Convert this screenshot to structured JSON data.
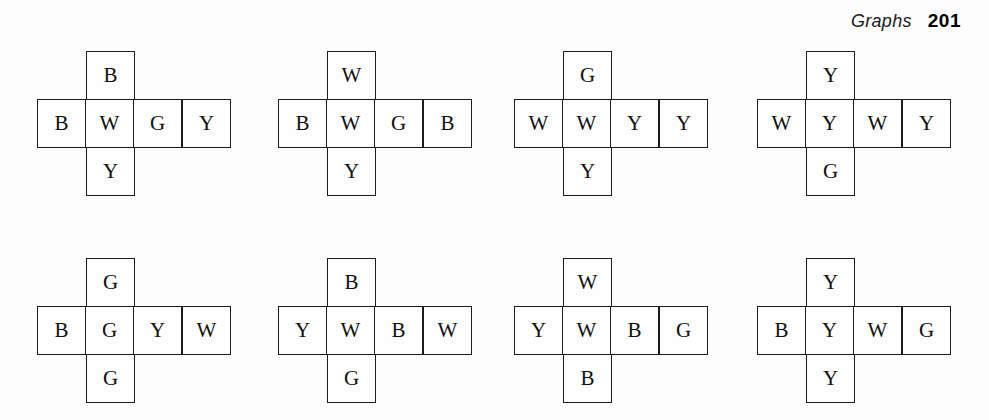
{
  "page": {
    "running_head_title": "Graphs",
    "page_number": "201",
    "background_color": "#fdfdfd",
    "ink_color": "#1c1c1c"
  },
  "figure": {
    "legend_letters": [
      "B",
      "W",
      "G",
      "Y"
    ],
    "nets": [
      {
        "id": "net-1",
        "top": "B",
        "middle": [
          "B",
          "W",
          "G",
          "Y"
        ],
        "bottom": "Y"
      },
      {
        "id": "net-2",
        "top": "W",
        "middle": [
          "B",
          "W",
          "G",
          "B"
        ],
        "bottom": "Y"
      },
      {
        "id": "net-3",
        "top": "G",
        "middle": [
          "W",
          "W",
          "Y",
          "Y"
        ],
        "bottom": "Y"
      },
      {
        "id": "net-4",
        "top": "Y",
        "middle": [
          "W",
          "Y",
          "W",
          "Y"
        ],
        "bottom": "G"
      },
      {
        "id": "net-5",
        "top": "G",
        "middle": [
          "B",
          "G",
          "Y",
          "W"
        ],
        "bottom": "G"
      },
      {
        "id": "net-6",
        "top": "B",
        "middle": [
          "Y",
          "W",
          "B",
          "W"
        ],
        "bottom": "G"
      },
      {
        "id": "net-7",
        "top": "W",
        "middle": [
          "Y",
          "W",
          "B",
          "G"
        ],
        "bottom": "B"
      },
      {
        "id": "net-8",
        "top": "Y",
        "middle": [
          "B",
          "Y",
          "W",
          "G"
        ],
        "bottom": "Y"
      }
    ]
  }
}
